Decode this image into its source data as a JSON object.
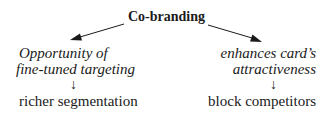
{
  "diagram": {
    "root": {
      "label": "Co-branding"
    },
    "branches": [
      {
        "id": "left",
        "benefit_lines": [
          "Opportunity of",
          "fine-tuned targeting"
        ],
        "arrow": "↓",
        "outcome": "richer segmentation"
      },
      {
        "id": "right",
        "benefit_lines": [
          "enhances card’s",
          "attractiveness"
        ],
        "arrow": "↓",
        "outcome": "block competitors"
      }
    ],
    "edges": [
      {
        "from": "Co-branding",
        "to": "Opportunity of fine-tuned targeting",
        "icon": "arrow-down-left-icon"
      },
      {
        "from": "Co-branding",
        "to": "enhances card’s attractiveness",
        "icon": "arrow-down-right-icon"
      },
      {
        "from": "Opportunity of fine-tuned targeting",
        "to": "richer segmentation",
        "icon": "arrow-down-icon"
      },
      {
        "from": "enhances card’s attractiveness",
        "to": "block competitors",
        "icon": "arrow-down-icon"
      }
    ],
    "colors": {
      "text": "#1a1a1a",
      "background": "#ffffff"
    }
  }
}
